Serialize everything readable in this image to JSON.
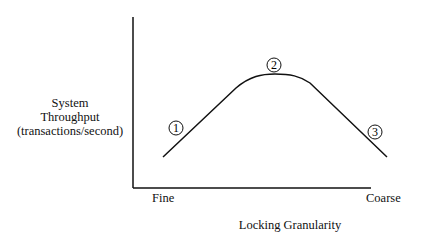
{
  "diagram": {
    "y_axis_label": [
      "System",
      "Throughput",
      "(transactions/second)"
    ],
    "x_axis_label": "Locking Granularity",
    "x_ticks": {
      "left": "Fine",
      "right": "Coarse"
    },
    "markers": [
      {
        "id": "1",
        "label": "1",
        "position": "rising slope (fine granularity)"
      },
      {
        "id": "2",
        "label": "2",
        "position": "peak"
      },
      {
        "id": "3",
        "label": "3",
        "position": "falling slope (coarse granularity)"
      }
    ],
    "curve_description": "Throughput rises from fine granularity to a peak at medium granularity, then falls toward coarse granularity",
    "colors": {
      "line": "#111111",
      "background": "#ffffff"
    }
  }
}
